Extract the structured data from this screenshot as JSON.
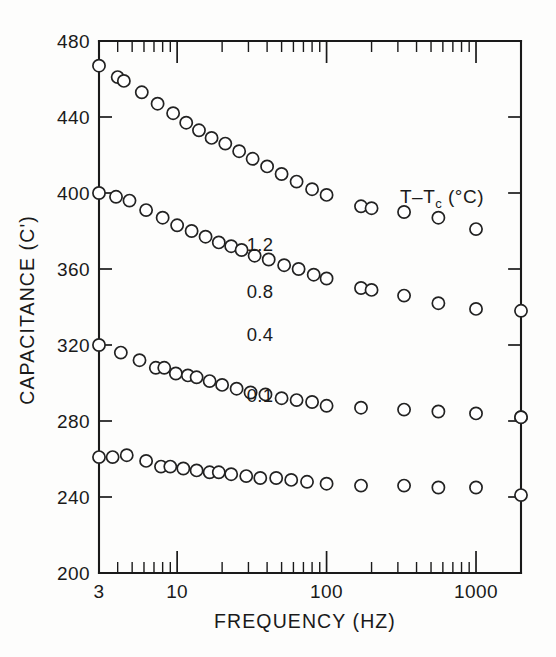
{
  "chart_data": {
    "type": "scatter",
    "title": "",
    "xlabel": "FREQUENCY (HZ)",
    "ylabel": "CAPACITANCE (C')",
    "xscale": "log",
    "yscale": "linear",
    "xlim": [
      3,
      2000
    ],
    "ylim": [
      200,
      480
    ],
    "grid": false,
    "marker": "open-circle",
    "x_ticks_major": [
      3,
      10,
      100,
      1000
    ],
    "x_tick_labels": [
      "3",
      "10",
      "100",
      "1000"
    ],
    "y_ticks_major": [
      200,
      240,
      280,
      320,
      360,
      400,
      440,
      480
    ],
    "y_tick_labels": [
      "200",
      "240",
      "280",
      "320",
      "360",
      "400",
      "440",
      "480"
    ],
    "legend_position": "inside-right",
    "legend_title": "T–T",
    "legend_title_sub": "c",
    "legend_title_units": "(°C)",
    "series": [
      {
        "name": "0.1",
        "label": "0.1",
        "label_x": 260,
        "label_y": 402,
        "points": [
          {
            "x": 3.0,
            "y": 467
          },
          {
            "x": 4.0,
            "y": 461
          },
          {
            "x": 4.4,
            "y": 459
          },
          {
            "x": 5.8,
            "y": 453
          },
          {
            "x": 7.4,
            "y": 447
          },
          {
            "x": 9.4,
            "y": 442
          },
          {
            "x": 11.5,
            "y": 437
          },
          {
            "x": 14.0,
            "y": 433
          },
          {
            "x": 17.0,
            "y": 429
          },
          {
            "x": 21.0,
            "y": 426
          },
          {
            "x": 26.0,
            "y": 422
          },
          {
            "x": 32.0,
            "y": 418
          },
          {
            "x": 40.0,
            "y": 414
          },
          {
            "x": 50.0,
            "y": 410
          },
          {
            "x": 63.0,
            "y": 406
          },
          {
            "x": 80.0,
            "y": 402
          },
          {
            "x": 100.0,
            "y": 399
          },
          {
            "x": 170.0,
            "y": 393
          },
          {
            "x": 200.0,
            "y": 392
          },
          {
            "x": 330.0,
            "y": 390
          },
          {
            "x": 560.0,
            "y": 387
          },
          {
            "x": 1000.0,
            "y": 381
          },
          {
            "x": 2000.0,
            "y": 338
          }
        ]
      },
      {
        "name": "0.4",
        "label": "0.4",
        "label_x": 260,
        "label_y": 341,
        "points": [
          {
            "x": 3.0,
            "y": 400
          },
          {
            "x": 3.9,
            "y": 398
          },
          {
            "x": 4.8,
            "y": 396
          },
          {
            "x": 6.2,
            "y": 391
          },
          {
            "x": 8.0,
            "y": 387
          },
          {
            "x": 10.0,
            "y": 383
          },
          {
            "x": 12.5,
            "y": 380
          },
          {
            "x": 15.5,
            "y": 377
          },
          {
            "x": 19.0,
            "y": 374
          },
          {
            "x": 23.0,
            "y": 372
          },
          {
            "x": 27.0,
            "y": 370
          },
          {
            "x": 33.0,
            "y": 367
          },
          {
            "x": 41.0,
            "y": 365
          },
          {
            "x": 52.0,
            "y": 362
          },
          {
            "x": 65.0,
            "y": 360
          },
          {
            "x": 82.0,
            "y": 357
          },
          {
            "x": 100.0,
            "y": 355
          },
          {
            "x": 170.0,
            "y": 350
          },
          {
            "x": 200.0,
            "y": 349
          },
          {
            "x": 330.0,
            "y": 346
          },
          {
            "x": 560.0,
            "y": 342
          },
          {
            "x": 1000.0,
            "y": 339
          },
          {
            "x": 2000.0,
            "y": 282
          }
        ]
      },
      {
        "name": "0.8",
        "label": "0.8",
        "label_x": 260,
        "label_y": 298,
        "points": [
          {
            "x": 3.0,
            "y": 320
          },
          {
            "x": 4.2,
            "y": 316
          },
          {
            "x": 5.6,
            "y": 312
          },
          {
            "x": 7.2,
            "y": 308
          },
          {
            "x": 8.2,
            "y": 308
          },
          {
            "x": 9.8,
            "y": 305
          },
          {
            "x": 11.8,
            "y": 304
          },
          {
            "x": 13.5,
            "y": 303
          },
          {
            "x": 16.5,
            "y": 301
          },
          {
            "x": 20.0,
            "y": 299
          },
          {
            "x": 25.0,
            "y": 297
          },
          {
            "x": 31.0,
            "y": 295
          },
          {
            "x": 39.0,
            "y": 294
          },
          {
            "x": 50.0,
            "y": 292
          },
          {
            "x": 63.0,
            "y": 291
          },
          {
            "x": 80.0,
            "y": 290
          },
          {
            "x": 100.0,
            "y": 288
          },
          {
            "x": 170.0,
            "y": 287
          },
          {
            "x": 330.0,
            "y": 286
          },
          {
            "x": 560.0,
            "y": 285
          },
          {
            "x": 1000.0,
            "y": 284
          },
          {
            "x": 2000.0,
            "y": 282
          }
        ]
      },
      {
        "name": "1.2",
        "label": "1.2",
        "label_x": 260,
        "label_y": 251,
        "points": [
          {
            "x": 3.0,
            "y": 261
          },
          {
            "x": 3.7,
            "y": 261
          },
          {
            "x": 4.6,
            "y": 262
          },
          {
            "x": 6.2,
            "y": 259
          },
          {
            "x": 7.8,
            "y": 256
          },
          {
            "x": 9.0,
            "y": 256
          },
          {
            "x": 11.0,
            "y": 255
          },
          {
            "x": 13.5,
            "y": 254
          },
          {
            "x": 16.5,
            "y": 253
          },
          {
            "x": 19.0,
            "y": 253
          },
          {
            "x": 23.0,
            "y": 252
          },
          {
            "x": 29.0,
            "y": 251
          },
          {
            "x": 36.0,
            "y": 250
          },
          {
            "x": 46.0,
            "y": 250
          },
          {
            "x": 58.0,
            "y": 249
          },
          {
            "x": 74.0,
            "y": 248
          },
          {
            "x": 100.0,
            "y": 247
          },
          {
            "x": 170.0,
            "y": 246
          },
          {
            "x": 330.0,
            "y": 246
          },
          {
            "x": 560.0,
            "y": 245
          },
          {
            "x": 1000.0,
            "y": 245
          },
          {
            "x": 2000.0,
            "y": 241
          }
        ]
      }
    ]
  },
  "axes": {
    "x_title": "FREQUENCY  (HZ)",
    "y_title": "CAPACITANCE  (C')"
  },
  "legend": {
    "title_main": "T–T",
    "title_sub": "c",
    "title_units": "  (°C)",
    "entries": [
      "0.1",
      "0.4",
      "0.8",
      "1.2"
    ]
  },
  "colors": {
    "ink": "#1a1a1a",
    "marker_stroke": "#222222",
    "marker_fill": "#ffffff",
    "background": "#fdfdfc"
  }
}
